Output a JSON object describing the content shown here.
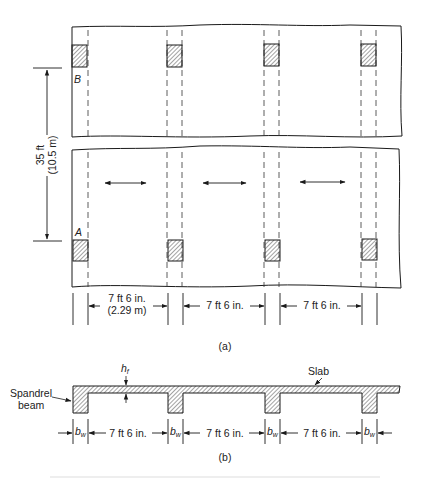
{
  "figure": {
    "plan": {
      "caption": "(a)",
      "column_labels": {
        "top_left": "B",
        "bottom_left": "A"
      },
      "vertical_dimension": {
        "imperial": "35 ft",
        "metric": "(10.5 m)"
      },
      "spans": [
        {
          "imperial": "7 ft 6 in.",
          "metric": "(2.29 m)"
        },
        {
          "imperial": "7 ft 6 in."
        },
        {
          "imperial": "7 ft 6 in."
        }
      ],
      "span_arrows": 3,
      "columns_per_row": 4
    },
    "section": {
      "caption": "(b)",
      "labels": {
        "slab": "Slab",
        "spandrel": "Spandrel",
        "beam": "beam",
        "flange_thickness": "h",
        "flange_thickness_sub": "f",
        "web_width": "b",
        "web_width_sub": "w"
      },
      "clear_spans": [
        "7 ft 6 in.",
        "7 ft 6 in.",
        "7 ft 6 in."
      ]
    },
    "colors": {
      "line": "#1a1a1a",
      "hatch": "#333333",
      "paper": "#ffffff"
    }
  }
}
